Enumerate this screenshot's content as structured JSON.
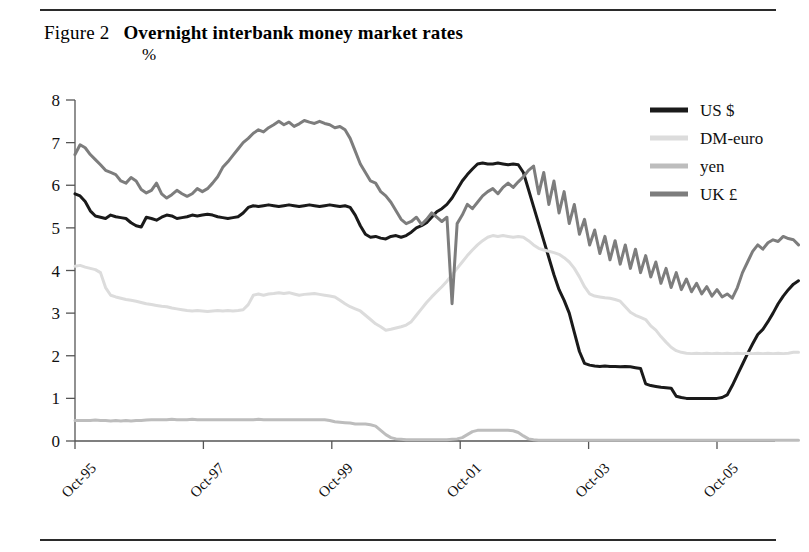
{
  "figure": {
    "label": "Figure 2",
    "title": "Overnight interbank money market rates",
    "unit": "%"
  },
  "legend": {
    "position": "top-right",
    "items": [
      {
        "name": "US $",
        "color": "#1a1a1a"
      },
      {
        "name": "DM-euro",
        "color": "#dcdcdc"
      },
      {
        "name": "yen",
        "color": "#bdbdbd"
      },
      {
        "name": "UK £",
        "color": "#7d7d7d"
      }
    ]
  },
  "chart_data": {
    "type": "line",
    "title": "Overnight interbank money market rates",
    "subtitle": "Figure 2",
    "xlabel": "",
    "ylabel": "%",
    "ylim": [
      0,
      8
    ],
    "yticks": [
      0,
      1,
      2,
      3,
      4,
      5,
      6,
      7,
      8
    ],
    "xticks": [
      "Oct-95",
      "Oct-97",
      "Oct-99",
      "Oct-01",
      "Oct-03",
      "Oct-05"
    ],
    "xtick_positions": [
      0.0,
      0.2,
      0.4,
      0.6,
      0.8,
      1.0
    ],
    "xtick_rotation": -45,
    "grid": false,
    "x_start": "Apr-95",
    "x_end": "Oct-05",
    "x_count": 127,
    "series": [
      {
        "name": "US $",
        "color": "#1a1a1a",
        "linewidth": 3.0,
        "values": [
          5.8,
          5.75,
          5.62,
          5.4,
          5.28,
          5.25,
          5.22,
          5.3,
          5.26,
          5.24,
          5.22,
          5.12,
          5.05,
          5.02,
          5.25,
          5.22,
          5.18,
          5.25,
          5.3,
          5.28,
          5.22,
          5.24,
          5.26,
          5.3,
          5.28,
          5.3,
          5.32,
          5.3,
          5.26,
          5.24,
          5.22,
          5.24,
          5.26,
          5.35,
          5.48,
          5.52,
          5.5,
          5.52,
          5.54,
          5.52,
          5.5,
          5.52,
          5.54,
          5.52,
          5.5,
          5.52,
          5.54,
          5.52,
          5.5,
          5.52,
          5.54,
          5.52,
          5.5,
          5.52,
          5.48,
          5.3,
          5.05,
          4.85,
          4.78,
          4.8,
          4.76,
          4.74,
          4.8,
          4.82,
          4.78,
          4.82,
          4.9,
          5.0,
          5.05,
          5.12,
          5.25,
          5.38,
          5.45,
          5.55,
          5.7,
          5.9,
          6.1,
          6.25,
          6.38,
          6.5,
          6.52,
          6.5,
          6.5,
          6.52,
          6.5,
          6.48,
          6.5,
          6.48,
          6.3,
          5.9,
          5.5,
          5.1,
          4.7,
          4.3,
          3.9,
          3.55,
          3.3,
          3.0,
          2.55,
          2.1,
          1.82,
          1.78,
          1.76,
          1.75,
          1.76,
          1.75,
          1.75,
          1.74,
          1.75,
          1.74,
          1.72,
          1.7,
          1.34,
          1.3,
          1.28,
          1.26,
          1.25,
          1.24,
          1.05,
          1.02,
          1.0,
          1.0,
          1.0,
          1.0,
          1.0,
          1.0,
          1.0,
          1.02,
          1.08,
          1.3,
          1.55,
          1.8,
          2.05,
          2.28,
          2.5,
          2.62,
          2.8,
          3.0,
          3.22,
          3.4,
          3.55,
          3.68,
          3.76
        ]
      },
      {
        "name": "DM-euro",
        "color": "#dcdcdc",
        "linewidth": 3.0,
        "values": [
          4.1,
          4.12,
          4.08,
          4.05,
          4.02,
          3.95,
          3.6,
          3.42,
          3.38,
          3.35,
          3.32,
          3.3,
          3.28,
          3.25,
          3.22,
          3.2,
          3.18,
          3.16,
          3.15,
          3.12,
          3.1,
          3.08,
          3.06,
          3.05,
          3.06,
          3.05,
          3.04,
          3.05,
          3.06,
          3.05,
          3.06,
          3.05,
          3.06,
          3.08,
          3.2,
          3.42,
          3.45,
          3.42,
          3.45,
          3.46,
          3.48,
          3.46,
          3.48,
          3.45,
          3.42,
          3.44,
          3.45,
          3.46,
          3.44,
          3.42,
          3.4,
          3.38,
          3.3,
          3.22,
          3.15,
          3.1,
          3.05,
          2.95,
          2.85,
          2.75,
          2.68,
          2.6,
          2.62,
          2.65,
          2.68,
          2.72,
          2.8,
          2.95,
          3.1,
          3.25,
          3.38,
          3.5,
          3.62,
          3.75,
          3.9,
          4.05,
          4.2,
          4.35,
          4.48,
          4.6,
          4.7,
          4.78,
          4.82,
          4.8,
          4.82,
          4.8,
          4.78,
          4.8,
          4.78,
          4.7,
          4.6,
          4.52,
          4.48,
          4.45,
          4.42,
          4.38,
          4.3,
          4.2,
          4.05,
          3.85,
          3.62,
          3.45,
          3.4,
          3.38,
          3.36,
          3.35,
          3.32,
          3.28,
          3.15,
          3.02,
          2.95,
          2.9,
          2.85,
          2.7,
          2.6,
          2.45,
          2.32,
          2.2,
          2.12,
          2.08,
          2.06,
          2.05,
          2.06,
          2.05,
          2.06,
          2.05,
          2.06,
          2.05,
          2.06,
          2.05,
          2.06,
          2.05,
          2.06,
          2.05,
          2.06,
          2.05,
          2.06,
          2.05,
          2.06,
          2.05,
          2.06,
          2.08,
          2.08
        ]
      },
      {
        "name": "yen",
        "color": "#bdbdbd",
        "linewidth": 3.0,
        "values": [
          0.48,
          0.48,
          0.48,
          0.48,
          0.49,
          0.48,
          0.48,
          0.47,
          0.48,
          0.47,
          0.48,
          0.47,
          0.48,
          0.48,
          0.49,
          0.5,
          0.5,
          0.5,
          0.5,
          0.51,
          0.5,
          0.5,
          0.5,
          0.51,
          0.5,
          0.5,
          0.5,
          0.5,
          0.5,
          0.5,
          0.5,
          0.5,
          0.5,
          0.5,
          0.5,
          0.5,
          0.51,
          0.5,
          0.5,
          0.5,
          0.5,
          0.5,
          0.5,
          0.5,
          0.5,
          0.5,
          0.5,
          0.5,
          0.5,
          0.5,
          0.48,
          0.45,
          0.44,
          0.43,
          0.42,
          0.4,
          0.4,
          0.4,
          0.38,
          0.35,
          0.25,
          0.15,
          0.08,
          0.05,
          0.04,
          0.03,
          0.03,
          0.03,
          0.03,
          0.03,
          0.03,
          0.03,
          0.03,
          0.03,
          0.04,
          0.05,
          0.08,
          0.15,
          0.22,
          0.25,
          0.25,
          0.25,
          0.25,
          0.25,
          0.25,
          0.25,
          0.24,
          0.2,
          0.12,
          0.05,
          0.03,
          0.02,
          0.02,
          0.02,
          0.02,
          0.02,
          0.02,
          0.02,
          0.02,
          0.02,
          0.02,
          0.02,
          0.02,
          0.02,
          0.02,
          0.02,
          0.02,
          0.02,
          0.02,
          0.02,
          0.02,
          0.02,
          0.02,
          0.02,
          0.02,
          0.02,
          0.02,
          0.02,
          0.02,
          0.02,
          0.02,
          0.02,
          0.02,
          0.02,
          0.02,
          0.02,
          0.02,
          0.02,
          0.02,
          0.02,
          0.02,
          0.02,
          0.02,
          0.02,
          0.02,
          0.02,
          0.02,
          0.02,
          0.02,
          0.02,
          0.02,
          0.02,
          0.02
        ]
      },
      {
        "name": "UK £",
        "color": "#7d7d7d",
        "linewidth": 3.0,
        "values": [
          6.72,
          6.95,
          6.88,
          6.72,
          6.6,
          6.48,
          6.35,
          6.3,
          6.25,
          6.1,
          6.05,
          6.18,
          6.1,
          5.9,
          5.82,
          5.88,
          6.05,
          5.8,
          5.7,
          5.78,
          5.88,
          5.8,
          5.74,
          5.8,
          5.92,
          5.85,
          5.92,
          6.05,
          6.2,
          6.42,
          6.55,
          6.7,
          6.85,
          7.0,
          7.1,
          7.22,
          7.3,
          7.25,
          7.35,
          7.42,
          7.5,
          7.42,
          7.48,
          7.38,
          7.44,
          7.52,
          7.48,
          7.45,
          7.5,
          7.45,
          7.42,
          7.35,
          7.38,
          7.3,
          7.1,
          6.8,
          6.5,
          6.3,
          6.1,
          6.05,
          5.85,
          5.75,
          5.6,
          5.4,
          5.2,
          5.1,
          5.15,
          5.25,
          5.08,
          5.2,
          5.35,
          5.25,
          5.15,
          5.25,
          3.22,
          5.1,
          5.3,
          5.55,
          5.45,
          5.6,
          5.75,
          5.85,
          5.92,
          5.8,
          5.95,
          6.05,
          5.95,
          6.08,
          6.2,
          6.35,
          6.45,
          5.8,
          6.3,
          5.55,
          6.1,
          5.35,
          5.85,
          5.1,
          5.55,
          4.85,
          5.2,
          4.6,
          4.95,
          4.4,
          4.8,
          4.25,
          4.7,
          4.15,
          4.6,
          4.05,
          4.5,
          3.95,
          4.35,
          3.85,
          4.2,
          3.7,
          4.05,
          3.6,
          3.95,
          3.55,
          3.8,
          3.5,
          3.7,
          3.45,
          3.62,
          3.4,
          3.55,
          3.38,
          3.45,
          3.35,
          3.6,
          3.95,
          4.2,
          4.45,
          4.6,
          4.5,
          4.65,
          4.72,
          4.68,
          4.8,
          4.75,
          4.72,
          4.6
        ]
      }
    ]
  }
}
